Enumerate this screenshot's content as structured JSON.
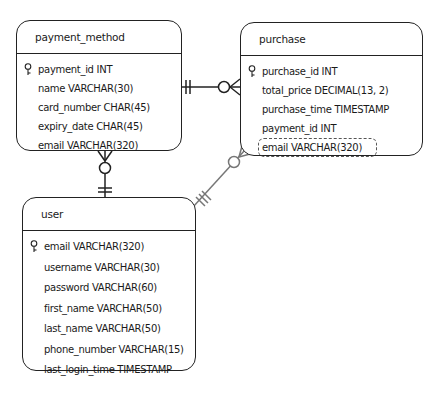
{
  "diagram": {
    "type": "entity-relationship",
    "entities": [
      {
        "id": "payment_method",
        "name": "payment_method",
        "fields": [
          {
            "text": "payment_id INT",
            "primary_key": true
          },
          {
            "text": "name VARCHAR(30)",
            "primary_key": false
          },
          {
            "text": "card_number CHAR(45)",
            "primary_key": false
          },
          {
            "text": "expiry_date CHAR(45)",
            "primary_key": false
          },
          {
            "text": "email VARCHAR(320)",
            "primary_key": false
          }
        ]
      },
      {
        "id": "purchase",
        "name": "purchase",
        "fields": [
          {
            "text": "purchase_id INT",
            "primary_key": true
          },
          {
            "text": "total_price DECIMAL(13, 2)",
            "primary_key": false
          },
          {
            "text": "purchase_time TIMESTAMP",
            "primary_key": false
          },
          {
            "text": "payment_id INT",
            "primary_key": false
          },
          {
            "text": "email VARCHAR(320)",
            "primary_key": false,
            "highlighted": "dashed"
          }
        ]
      },
      {
        "id": "user",
        "name": "user",
        "fields": [
          {
            "text": "email VARCHAR(320)",
            "primary_key": true
          },
          {
            "text": "username VARCHAR(30)",
            "primary_key": false
          },
          {
            "text": "password VARCHAR(60)",
            "primary_key": false
          },
          {
            "text": "first_name VARCHAR(50)",
            "primary_key": false
          },
          {
            "text": "last_name VARCHAR(50)",
            "primary_key": false
          },
          {
            "text": "phone_number VARCHAR(15)",
            "primary_key": false
          },
          {
            "text": "last_login_time TIMESTAMP",
            "primary_key": false
          }
        ]
      }
    ],
    "relationships": [
      {
        "from": "payment_method",
        "from_cardinality": "exactly-one",
        "to": "purchase",
        "to_cardinality": "zero-or-many",
        "style": "solid",
        "color": "#222222"
      },
      {
        "from": "user",
        "from_cardinality": "exactly-one",
        "to": "payment_method",
        "to_cardinality": "zero-or-many",
        "style": "solid",
        "color": "#222222"
      },
      {
        "from": "user",
        "from_cardinality": "exactly-one",
        "to": "purchase",
        "to_cardinality": "zero-or-many",
        "style": "solid",
        "color": "#777777"
      }
    ]
  }
}
